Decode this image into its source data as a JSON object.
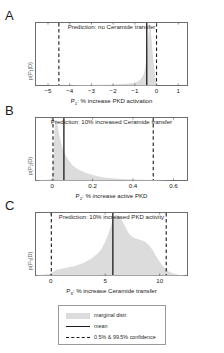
{
  "figure": {
    "panels": [
      {
        "letter": "A",
        "title": "Prediction: no Ceramide transfer",
        "ylabel": "p(P₁|D)",
        "xlabel_main": "P",
        "xlabel_sub": "1",
        "xlabel_rest": ": % increase PKD activation",
        "ticks": [
          "-5",
          "-4",
          "-3",
          "-2",
          "-1",
          "0",
          "1"
        ]
      },
      {
        "letter": "B",
        "title": "Prediction: 10% increased Ceramide transfer",
        "ylabel": "p(P₂|D)",
        "xlabel_main": "P",
        "xlabel_sub": "2",
        "xlabel_rest": ": % increase active PKD",
        "ticks": [
          "0",
          "0.2",
          "0.4",
          "0.6"
        ]
      },
      {
        "letter": "C",
        "title": "Prediction: 10% increased PKD activity",
        "ylabel": "p(P₃|D)",
        "xlabel_main": "P",
        "xlabel_sub": "3",
        "xlabel_rest": ": % increase Ceramide transfer",
        "ticks": [
          "0",
          "5",
          "10"
        ]
      }
    ],
    "legend": {
      "items": [
        {
          "label": "marginal distr.",
          "key": "area-swatch"
        },
        {
          "label": "mean",
          "key": "solid-line"
        },
        {
          "label": "0.5% & 99.5% confidence",
          "key": "dashed-line"
        }
      ]
    },
    "colors": {
      "distribution_fill": "#dcdcdc",
      "mean_line": "#1a1a1a",
      "confidence_line": "#1a1a1a",
      "axis": "#6d6d6d"
    }
  },
  "chart_data": [
    {
      "type": "area",
      "panel": "A",
      "title": "Prediction: no Ceramide transfer",
      "xlabel": "P1: % increase PKD activation",
      "ylabel": "p(P1|D)",
      "xlim": [
        -5.6,
        1.45
      ],
      "ylim": [
        0,
        1.0
      ],
      "xticks": [
        -5,
        -4,
        -3,
        -2,
        -1,
        0,
        1
      ],
      "grid": false,
      "mean": -0.45,
      "confidence_low": -4.5,
      "confidence_high": 0.0,
      "x": [
        -5.6,
        -5.0,
        -4.5,
        -4.0,
        -3.5,
        -3.0,
        -2.5,
        -2.0,
        -1.6,
        -1.3,
        -1.1,
        -0.95,
        -0.85,
        -0.75,
        -0.68,
        -0.6,
        -0.55,
        -0.5,
        -0.46,
        -0.42,
        -0.38,
        -0.34,
        -0.3,
        -0.26,
        -0.22,
        -0.18,
        -0.14,
        -0.1,
        -0.06,
        -0.03,
        0.0,
        0.05,
        0.3,
        1.45
      ],
      "y": [
        0,
        0,
        0.004,
        0.006,
        0.008,
        0.01,
        0.013,
        0.018,
        0.025,
        0.033,
        0.042,
        0.055,
        0.07,
        0.095,
        0.125,
        0.175,
        0.24,
        0.34,
        0.46,
        0.62,
        0.82,
        0.96,
        1.0,
        0.9,
        0.72,
        0.55,
        0.4,
        0.28,
        0.16,
        0.07,
        0.0,
        0,
        0,
        0
      ]
    },
    {
      "type": "area",
      "panel": "B",
      "title": "Prediction: 10% increased Ceramide transfer",
      "xlabel": "P2: % increase active PKD",
      "ylabel": "p(P2|D)",
      "xlim": [
        -0.085,
        0.672
      ],
      "ylim": [
        0,
        1.0
      ],
      "xticks": [
        0,
        0.2,
        0.4,
        0.6
      ],
      "grid": false,
      "mean": 0.058,
      "confidence_low": 0.004,
      "confidence_high": 0.5,
      "x": [
        -0.085,
        0.0,
        0.004,
        0.008,
        0.012,
        0.016,
        0.02,
        0.024,
        0.028,
        0.032,
        0.038,
        0.044,
        0.05,
        0.058,
        0.066,
        0.076,
        0.086,
        0.098,
        0.112,
        0.128,
        0.145,
        0.165,
        0.185,
        0.205,
        0.225,
        0.25,
        0.28,
        0.31,
        0.35,
        0.4,
        0.45,
        0.5,
        0.55,
        0.6,
        0.672
      ],
      "y": [
        0,
        0.02,
        0.18,
        0.52,
        0.82,
        0.97,
        1.0,
        0.96,
        0.88,
        0.8,
        0.7,
        0.62,
        0.55,
        0.48,
        0.42,
        0.36,
        0.31,
        0.26,
        0.22,
        0.185,
        0.155,
        0.128,
        0.105,
        0.086,
        0.07,
        0.055,
        0.042,
        0.032,
        0.024,
        0.016,
        0.011,
        0.007,
        0.004,
        0.002,
        0
      ]
    },
    {
      "type": "area",
      "panel": "C",
      "title": "Prediction: 10% increased PKD activity",
      "xlabel": "P3: % increase Ceramide transfer",
      "ylabel": "p(P3|D)",
      "xlim": [
        -1.45,
        12.6
      ],
      "ylim": [
        0,
        1.0
      ],
      "xticks": [
        0,
        5,
        10
      ],
      "grid": false,
      "mean": 5.7,
      "confidence_low": 0.05,
      "confidence_high": 10.6,
      "x": [
        -1.45,
        0.0,
        0.3,
        0.7,
        1.1,
        1.5,
        1.9,
        2.3,
        2.7,
        3.1,
        3.5,
        3.9,
        4.3,
        4.6,
        4.9,
        5.15,
        5.4,
        5.6,
        5.8,
        6.0,
        6.2,
        6.45,
        6.7,
        6.95,
        7.2,
        7.5,
        7.8,
        8.1,
        8.4,
        8.7,
        9.0,
        9.3,
        9.6,
        9.9,
        10.2,
        10.5,
        10.8,
        11.2,
        11.7,
        12.6
      ],
      "y": [
        0,
        0.03,
        0.075,
        0.1,
        0.115,
        0.13,
        0.145,
        0.16,
        0.185,
        0.215,
        0.255,
        0.3,
        0.36,
        0.42,
        0.52,
        0.62,
        0.74,
        0.86,
        0.95,
        1.0,
        0.985,
        0.93,
        0.85,
        0.76,
        0.68,
        0.63,
        0.605,
        0.59,
        0.575,
        0.55,
        0.5,
        0.43,
        0.34,
        0.25,
        0.175,
        0.115,
        0.07,
        0.035,
        0.012,
        0
      ]
    }
  ]
}
